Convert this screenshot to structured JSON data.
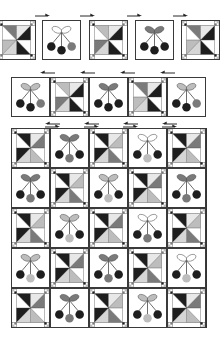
{
  "diagram": {
    "title": "",
    "colors": {
      "dark": "#1e1e1e",
      "medium": "#7a7a7a",
      "light": "#bdbdbd",
      "outline": "#3a3a3a",
      "background": "#ffffff"
    },
    "row1": {
      "arrow_direction": "right",
      "blocks": [
        "pinwheel",
        "cherry",
        "pinwheel",
        "cherry",
        "pinwheel"
      ],
      "cherry_leaf_styles": [
        "outline",
        "medium"
      ]
    },
    "row2": {
      "arrow_direction": "left",
      "blocks": [
        "cherry",
        "pinwheel",
        "cherry",
        "pinwheel",
        "cherry"
      ],
      "cherry_leaf_styles": [
        "light",
        "medium",
        "light"
      ]
    },
    "quilt": {
      "rows": 5,
      "cols": 5,
      "top_arrow_direction": "right",
      "layout": [
        [
          "pinwheel",
          "cherry",
          "pinwheel",
          "cherry",
          "pinwheel"
        ],
        [
          "cherry",
          "pinwheel",
          "cherry",
          "pinwheel",
          "cherry"
        ],
        [
          "pinwheel",
          "cherry",
          "pinwheel",
          "cherry",
          "pinwheel"
        ],
        [
          "cherry",
          "pinwheel",
          "cherry",
          "pinwheel",
          "cherry"
        ],
        [
          "pinwheel",
          "cherry",
          "pinwheel",
          "cherry",
          "pinwheel"
        ]
      ]
    },
    "block_types": {
      "pinwheel": "Pinwheel block with four-patch corner squares",
      "cherry": "Cherry applique block with three cherries and two leaves"
    }
  }
}
